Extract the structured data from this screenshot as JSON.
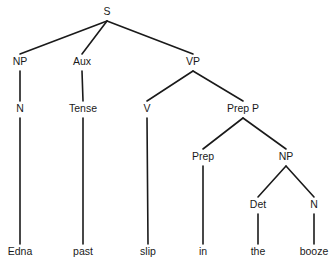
{
  "diagram": {
    "type": "syntax-tree",
    "nodes": [
      {
        "id": "S",
        "label": "S",
        "parent": null
      },
      {
        "id": "NP1",
        "label": "NP",
        "parent": "S"
      },
      {
        "id": "Aux",
        "label": "Aux",
        "parent": "S"
      },
      {
        "id": "VP",
        "label": "VP",
        "parent": "S"
      },
      {
        "id": "N1",
        "label": "N",
        "parent": "NP1"
      },
      {
        "id": "Tense",
        "label": "Tense",
        "parent": "Aux"
      },
      {
        "id": "V",
        "label": "V",
        "parent": "VP"
      },
      {
        "id": "PrepP",
        "label": "Prep P",
        "parent": "VP"
      },
      {
        "id": "Prep",
        "label": "Prep",
        "parent": "PrepP"
      },
      {
        "id": "NP2",
        "label": "NP",
        "parent": "PrepP"
      },
      {
        "id": "Det",
        "label": "Det",
        "parent": "NP2"
      },
      {
        "id": "N2",
        "label": "N",
        "parent": "NP2"
      },
      {
        "id": "w_edna",
        "label": "Edna",
        "parent": "N1"
      },
      {
        "id": "w_past",
        "label": "past",
        "parent": "Tense"
      },
      {
        "id": "w_slip",
        "label": "slip",
        "parent": "V"
      },
      {
        "id": "w_in",
        "label": "in",
        "parent": "Prep"
      },
      {
        "id": "w_the",
        "label": "the",
        "parent": "Det"
      },
      {
        "id": "w_booze",
        "label": "booze",
        "parent": "N2"
      }
    ]
  }
}
